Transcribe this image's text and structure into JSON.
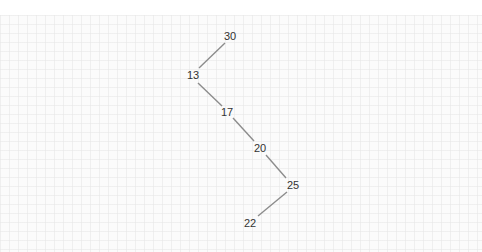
{
  "diagram": {
    "type": "binary-search-tree",
    "colors": {
      "background": "#fbfbfb",
      "edge": "#8c8c8c",
      "text": "#333333"
    },
    "nodes": [
      {
        "id": "n30",
        "label": "30",
        "x": 230,
        "y": 36
      },
      {
        "id": "n13",
        "label": "13",
        "x": 193,
        "y": 75
      },
      {
        "id": "n17",
        "label": "17",
        "x": 227,
        "y": 112
      },
      {
        "id": "n20",
        "label": "20",
        "x": 260,
        "y": 148
      },
      {
        "id": "n25",
        "label": "25",
        "x": 293,
        "y": 185
      },
      {
        "id": "n22",
        "label": "22",
        "x": 250,
        "y": 223
      }
    ],
    "edges": [
      {
        "from": "30",
        "to": "13",
        "side": "left"
      },
      {
        "from": "13",
        "to": "17",
        "side": "right"
      },
      {
        "from": "17",
        "to": "20",
        "side": "right"
      },
      {
        "from": "20",
        "to": "25",
        "side": "right"
      },
      {
        "from": "25",
        "to": "22",
        "side": "left"
      }
    ]
  }
}
